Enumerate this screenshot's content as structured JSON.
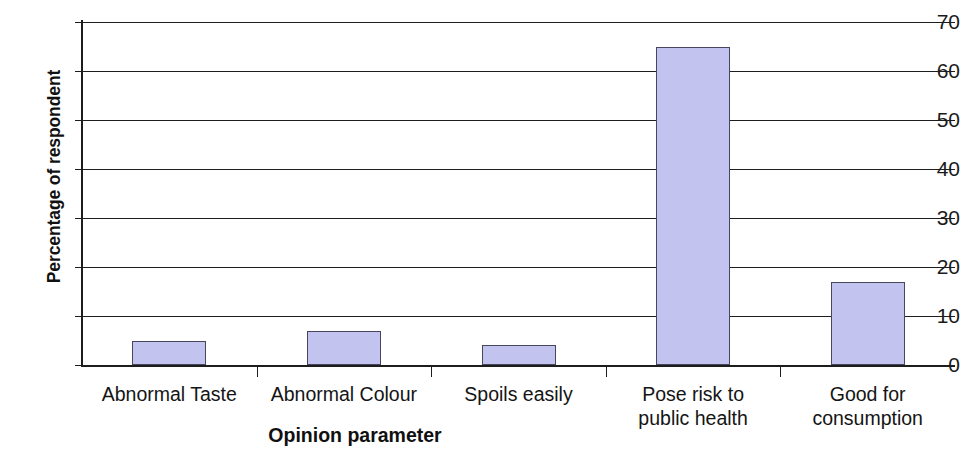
{
  "chart_data": {
    "type": "bar",
    "title": "",
    "subtitle": "",
    "xlabel": "Opinion parameter",
    "ylabel": "Percentage of respondent",
    "categories": [
      "Abnormal Taste",
      "Abnormal Colour",
      "Spoils easily",
      "Pose risk to\npublic health",
      "Good for\nconsumption"
    ],
    "values": [
      5,
      7,
      4,
      65,
      17
    ],
    "ylim": [
      0,
      70
    ],
    "ytick_labels": [
      "70",
      "60",
      "50",
      "40",
      "30",
      "20",
      "10",
      "0"
    ],
    "ytick_values": [
      70,
      60,
      50,
      40,
      30,
      20,
      10,
      0
    ],
    "ytick_step": 10,
    "grid": "horizontal",
    "legend": "none",
    "bar_fill_color": "#c3c3ef",
    "bar_border_color": "#46465f",
    "axis_color": "#1d1d1d"
  }
}
